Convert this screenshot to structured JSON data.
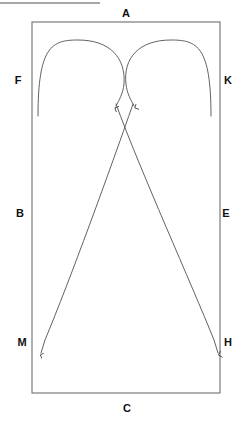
{
  "figure": {
    "title_rule": {
      "present": true,
      "x1": 0,
      "y1": 3,
      "x2": 100,
      "y2": 3,
      "color": "#8a8a8a",
      "width": 1.4
    },
    "stroke_color": "#5a5a5a",
    "label_color": "#111111",
    "background": "#ffffff",
    "canvas": {
      "width": 245,
      "height": 425
    }
  },
  "boundary": {
    "name": "outer-rectangle",
    "x": 32,
    "y": 22,
    "width": 188,
    "height": 371,
    "stroke": "#6e6e6e",
    "stroke_width": 1.1,
    "fill": "none"
  },
  "labels": [
    {
      "id": "A",
      "text": "A",
      "x": 126,
      "y": 13,
      "side": "top"
    },
    {
      "id": "F",
      "text": "F",
      "x": 18,
      "y": 80,
      "side": "left"
    },
    {
      "id": "K",
      "text": "K",
      "x": 228,
      "y": 80,
      "side": "right"
    },
    {
      "id": "B",
      "text": "B",
      "x": 20,
      "y": 213,
      "side": "left"
    },
    {
      "id": "E",
      "text": "E",
      "x": 226,
      "y": 213,
      "side": "right"
    },
    {
      "id": "M",
      "text": "M",
      "x": 22,
      "y": 342,
      "side": "left"
    },
    {
      "id": "H",
      "text": "H",
      "x": 228,
      "y": 342,
      "side": "right"
    },
    {
      "id": "C",
      "text": "C",
      "x": 127,
      "y": 408,
      "side": "bottom"
    }
  ],
  "arrows": [
    {
      "id": "left-arc",
      "name": "left-curved-arrow",
      "description": "arc rising from lower-left, over the top, ending with a downward arrowhead near top-center-left",
      "path": "M 38,116 C 38,46 52,40 78,40 C 110,40 126,58 124,84 C 123,94 119,100 116,106",
      "arrowhead_at": {
        "x": 116,
        "y": 107
      },
      "arrowhead_dir": "down"
    },
    {
      "id": "right-arc",
      "name": "right-curved-arrow",
      "description": "arc rising from lower-right, over the top, ending with a downward arrowhead near top-center-right",
      "path": "M 211,116 C 211,46 197,40 171,40 C 139,40 123,58 126,84 C 127,94 131,100 134,106",
      "arrowhead_at": {
        "x": 134,
        "y": 107
      },
      "arrowhead_dir": "down"
    },
    {
      "id": "to-M",
      "name": "diagonal-arrow-to-m",
      "description": "long line from top-center-right down-left to the M corner, downward arrowhead",
      "path": "M 133,104 C 110,170 70,280 45,340 L 41,353",
      "arrowhead_at": {
        "x": 41,
        "y": 361
      },
      "arrowhead_dir": "down"
    },
    {
      "id": "to-H",
      "name": "diagonal-arrow-to-h",
      "description": "long line from top-center-left down-right to the H corner, downward arrowhead",
      "path": "M 116,104 C 140,170 192,285 214,340 L 218,353",
      "arrowhead_at": {
        "x": 218,
        "y": 361
      },
      "arrowhead_dir": "down"
    }
  ]
}
